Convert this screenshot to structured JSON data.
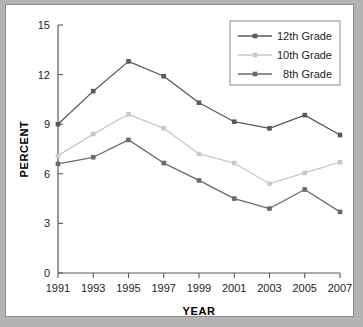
{
  "chart_data": {
    "type": "line",
    "title": "",
    "xlabel": "YEAR",
    "ylabel": "PERCENT",
    "x": [
      1991,
      1993,
      1995,
      1997,
      1999,
      2001,
      2003,
      2005,
      2007
    ],
    "xticklabels": [
      "1991",
      "1993",
      "1995",
      "1997",
      "1999",
      "2001",
      "2003",
      "2005",
      "2007"
    ],
    "yticks": [
      0,
      3,
      6,
      9,
      12,
      15
    ],
    "yticklabels": [
      "0",
      "3",
      "6",
      "9",
      "12",
      "15"
    ],
    "xlim": [
      1991,
      2007
    ],
    "ylim": [
      0,
      15
    ],
    "grid": false,
    "legend_position": "top-right",
    "series": [
      {
        "name": "12th Grade",
        "color": "#595959",
        "marker": "square",
        "values": [
          9.0,
          11.0,
          12.8,
          11.9,
          10.3,
          9.15,
          8.75,
          9.55,
          8.35
        ]
      },
      {
        "name": "10th Grade",
        "color": "#c8c8c8",
        "marker": "square",
        "values": [
          7.1,
          8.4,
          9.6,
          8.75,
          7.2,
          6.65,
          5.4,
          6.05,
          6.7
        ]
      },
      {
        "name": "8th Grade",
        "color": "#6b6b6b",
        "marker": "square",
        "values": [
          6.6,
          7.0,
          8.05,
          6.65,
          5.6,
          4.5,
          3.9,
          5.05,
          3.7
        ]
      }
    ]
  },
  "colors": {
    "page_background": "#b3b3b3",
    "panel_background": "#ffffff",
    "panel_border": "#8d8d8d",
    "axis": "#58595b",
    "text": "#231f20"
  }
}
